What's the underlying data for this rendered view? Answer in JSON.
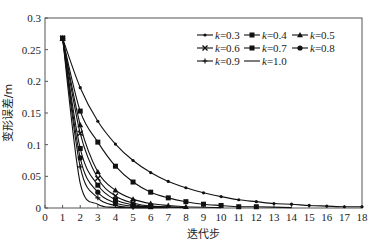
{
  "chart_data": {
    "type": "line",
    "title": "",
    "xlabel": "迭代步",
    "ylabel": "变形误差/m",
    "xlim": [
      0,
      18
    ],
    "ylim": [
      0,
      0.3
    ],
    "x_ticks": [
      "0",
      "1",
      "2",
      "3",
      "4",
      "5",
      "6",
      "7",
      "8",
      "9",
      "10",
      "11",
      "12",
      "13",
      "14",
      "15",
      "16",
      "17",
      "18"
    ],
    "y_ticks": [
      "0",
      "0.05",
      "0.1",
      "0.15",
      "0.2",
      "0.25",
      "0.3"
    ],
    "grid": false,
    "legend_position": "upper right (inside, 3 columns)",
    "series": [
      {
        "name": "k=0.3",
        "marker": "dash",
        "x": [
          1,
          2,
          3,
          4,
          5,
          6,
          7,
          8,
          9,
          10,
          11,
          12,
          13,
          14,
          15,
          16,
          17,
          18
        ],
        "values": [
          0.268,
          0.19,
          0.137,
          0.101,
          0.075,
          0.056,
          0.042,
          0.032,
          0.024,
          0.018,
          0.013,
          0.01,
          0.007,
          0.006,
          0.004,
          0.003,
          0.002,
          0.002
        ]
      },
      {
        "name": "k=0.4",
        "marker": "square",
        "x": [
          1,
          2,
          3,
          4,
          5,
          6,
          7,
          8,
          9,
          10,
          11,
          12
        ],
        "values": [
          0.268,
          0.153,
          0.104,
          0.066,
          0.041,
          0.025,
          0.016,
          0.01,
          0.006,
          0.004,
          0.002,
          0.002
        ]
      },
      {
        "name": "k=0.5",
        "marker": "triangle",
        "x": [
          1,
          2,
          3,
          4,
          5,
          6,
          7,
          8
        ],
        "values": [
          0.268,
          0.131,
          0.057,
          0.028,
          0.014,
          0.007,
          0.004,
          0.002
        ]
      },
      {
        "name": "k=0.6",
        "marker": "cross",
        "x": [
          1,
          2,
          3,
          4,
          5,
          6
        ],
        "values": [
          0.268,
          0.118,
          0.047,
          0.019,
          0.008,
          0.003
        ]
      },
      {
        "name": "k=0.7",
        "marker": "square",
        "x": [
          1,
          2,
          3,
          4,
          5,
          6
        ],
        "values": [
          0.268,
          0.094,
          0.036,
          0.013,
          0.005,
          0.002
        ]
      },
      {
        "name": "k=0.8",
        "marker": "circle",
        "x": [
          1,
          2,
          3,
          4,
          5
        ],
        "values": [
          0.268,
          0.079,
          0.025,
          0.008,
          0.003
        ]
      },
      {
        "name": "k=0.9",
        "marker": "plus",
        "x": [
          1,
          2,
          3,
          4,
          5
        ],
        "values": [
          0.268,
          0.065,
          0.016,
          0.004,
          0.001
        ]
      },
      {
        "name": "k=1.0",
        "marker": "none",
        "x": [
          1,
          2,
          3,
          4
        ],
        "values": [
          0.268,
          0.039,
          0.006,
          0.001
        ]
      }
    ]
  }
}
